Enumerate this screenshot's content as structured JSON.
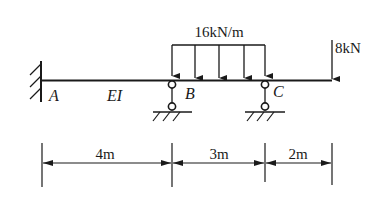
{
  "diagram": {
    "type": "continuous beam",
    "labels": {
      "support_a": "A",
      "support_b": "B",
      "support_c": "C",
      "stiffness": "EI"
    },
    "loads": {
      "distributed": {
        "label": "16kN/m",
        "value": 16,
        "unit": "kN/m",
        "span": "B-C"
      },
      "point": {
        "label": "8kN",
        "value": 8,
        "unit": "kN",
        "location": "free end"
      }
    },
    "dimensions": [
      {
        "label": "4m",
        "from": "A",
        "to": "B"
      },
      {
        "label": "3m",
        "from": "B",
        "to": "C"
      },
      {
        "label": "2m",
        "from": "C",
        "to": "end"
      }
    ],
    "colors": {
      "ink": "#1a1a1a",
      "background": "#ffffff"
    }
  }
}
